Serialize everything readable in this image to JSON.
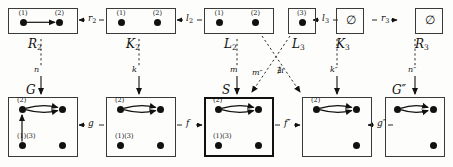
{
  "diagram": {
    "top_row": [
      {
        "id": "R2",
        "name": "R",
        "sub": "2",
        "x": 8,
        "y": 8,
        "w": 70,
        "h": 26,
        "thick": false,
        "nodes": [
          {
            "x": 0.22,
            "y": 0.55,
            "label": "(1)"
          },
          {
            "x": 0.74,
            "y": 0.55,
            "label": "(2)"
          }
        ],
        "edges": [
          {
            "from": 0,
            "to": 1,
            "type": "straight"
          }
        ]
      },
      {
        "id": "K2",
        "name": "K",
        "sub": "2",
        "x": 106,
        "y": 8,
        "w": 70,
        "h": 26,
        "thick": false,
        "nodes": [
          {
            "x": 0.22,
            "y": 0.55,
            "label": "(1)"
          },
          {
            "x": 0.74,
            "y": 0.55,
            "label": "(2)"
          }
        ],
        "edges": []
      },
      {
        "id": "L2",
        "name": "L",
        "sub": "2",
        "x": 204,
        "y": 8,
        "w": 70,
        "h": 26,
        "thick": false,
        "nodes": [
          {
            "x": 0.22,
            "y": 0.55,
            "label": "(1)"
          },
          {
            "x": 0.74,
            "y": 0.55,
            "label": "(2)"
          }
        ],
        "edges": []
      },
      {
        "id": "L3",
        "name": "L",
        "sub": "3",
        "x": 288,
        "y": 8,
        "w": 28,
        "h": 26,
        "thick": false,
        "nodes": [
          {
            "x": 0.5,
            "y": 0.55,
            "label": "(3)"
          }
        ],
        "edges": []
      },
      {
        "id": "K3",
        "name": "K",
        "sub": "3",
        "x": 336,
        "y": 8,
        "w": 28,
        "h": 26,
        "thick": false,
        "nodes": [],
        "empty": "∅",
        "edges": []
      },
      {
        "id": "R3",
        "name": "R",
        "sub": "3",
        "x": 415,
        "y": 8,
        "w": 28,
        "h": 26,
        "thick": false,
        "nodes": [],
        "empty": "∅",
        "edges": []
      }
    ],
    "bottom_row": [
      {
        "id": "G",
        "name": "G",
        "sub": "",
        "x": 8,
        "y": 97,
        "w": 70,
        "h": 60,
        "thick": false,
        "nodes": [
          {
            "x": 0.2,
            "y": 0.2,
            "label": "(2)"
          },
          {
            "x": 0.78,
            "y": 0.2,
            "label": ""
          },
          {
            "x": 0.2,
            "y": 0.8,
            "label": "(1)(3)"
          },
          {
            "x": 0.78,
            "y": 0.8,
            "label": ""
          }
        ],
        "edges": [
          {
            "from": 0,
            "to": 1,
            "type": "double"
          },
          {
            "from": 2,
            "to": 0,
            "type": "vertical"
          }
        ]
      },
      {
        "id": "D",
        "name": "",
        "sub": "",
        "x": 106,
        "y": 97,
        "w": 70,
        "h": 60,
        "thick": false,
        "nodes": [
          {
            "x": 0.2,
            "y": 0.2,
            "label": "(2)"
          },
          {
            "x": 0.78,
            "y": 0.2,
            "label": ""
          },
          {
            "x": 0.2,
            "y": 0.8,
            "label": "(1)(3)"
          },
          {
            "x": 0.78,
            "y": 0.8,
            "label": ""
          }
        ],
        "edges": [
          {
            "from": 0,
            "to": 1,
            "type": "double"
          }
        ]
      },
      {
        "id": "S",
        "name": "S",
        "sub": "",
        "x": 204,
        "y": 97,
        "w": 70,
        "h": 60,
        "thick": true,
        "nodes": [
          {
            "x": 0.2,
            "y": 0.2,
            "label": "(2)"
          },
          {
            "x": 0.78,
            "y": 0.2,
            "label": ""
          },
          {
            "x": 0.2,
            "y": 0.8,
            "label": "(1)(3)"
          },
          {
            "x": 0.78,
            "y": 0.8,
            "label": ""
          }
        ],
        "edges": [
          {
            "from": 0,
            "to": 1,
            "type": "double"
          }
        ]
      },
      {
        "id": "Dpp",
        "name": "",
        "sub": "",
        "x": 302,
        "y": 97,
        "w": 70,
        "h": 60,
        "thick": false,
        "nodes": [
          {
            "x": 0.2,
            "y": 0.2,
            "label": "(2)"
          },
          {
            "x": 0.78,
            "y": 0.2,
            "label": ""
          },
          {
            "x": 0.78,
            "y": 0.8,
            "label": ""
          }
        ],
        "edges": [
          {
            "from": 0,
            "to": 1,
            "type": "double"
          }
        ]
      },
      {
        "id": "Gpp",
        "name": "G″",
        "sub": "",
        "x": 385,
        "y": 97,
        "w": 60,
        "h": 60,
        "thick": false,
        "nodes": [
          {
            "x": 0.2,
            "y": 0.2,
            "label": ""
          },
          {
            "x": 0.8,
            "y": 0.2,
            "label": ""
          },
          {
            "x": 0.8,
            "y": 0.8,
            "label": ""
          }
        ],
        "edges": [
          {
            "from": 0,
            "to": 1,
            "type": "double"
          }
        ]
      }
    ],
    "horizontal_morphisms": [
      {
        "label": "r",
        "sub": "2",
        "x": 88,
        "y": 16,
        "dir": "left"
      },
      {
        "label": "l",
        "sub": "2",
        "x": 186,
        "y": 16,
        "dir": "left"
      },
      {
        "label": "l",
        "sub": "3",
        "x": 322,
        "y": 16,
        "dir": "left"
      },
      {
        "label": "r",
        "sub": "3",
        "x": 381,
        "y": 16,
        "dir": "right"
      },
      {
        "label": "g",
        "sub": "",
        "x": 88,
        "y": 121,
        "dir": "left"
      },
      {
        "label": "f",
        "sub": "",
        "x": 186,
        "y": 121,
        "dir": "right"
      },
      {
        "label": "f″",
        "sub": "",
        "x": 284,
        "y": 121,
        "dir": "right"
      },
      {
        "label": "g″",
        "sub": "",
        "x": 377,
        "y": 121,
        "dir": "left"
      }
    ],
    "vertical_morphisms": [
      {
        "label": "n",
        "x": 41,
        "y": 72
      },
      {
        "label": "k",
        "x": 139,
        "y": 72
      },
      {
        "label": "m",
        "x": 237,
        "y": 72
      },
      {
        "label": "k″",
        "x": 337,
        "y": 72
      },
      {
        "label": "n″",
        "x": 415,
        "y": 72
      }
    ],
    "diagonal_morphisms": [
      {
        "label": "m″",
        "x": 252,
        "y": 68
      },
      {
        "label": "∄i",
        "x": 277,
        "y": 66
      }
    ],
    "box_names": [
      {
        "text": "R",
        "sub": "2",
        "x": 28,
        "y": 37
      },
      {
        "text": "K",
        "sub": "2",
        "x": 126,
        "y": 37
      },
      {
        "text": "L",
        "sub": "2",
        "x": 224,
        "y": 37
      },
      {
        "text": "L",
        "sub": "3",
        "x": 292,
        "y": 37
      },
      {
        "text": "K",
        "sub": "3",
        "x": 336,
        "y": 37
      },
      {
        "text": "R",
        "sub": "3",
        "x": 415,
        "y": 37
      },
      {
        "text": "G",
        "sub": "",
        "x": 26,
        "y": 83
      },
      {
        "text": "S",
        "sub": "",
        "x": 222,
        "y": 83
      },
      {
        "text": "G″",
        "sub": "",
        "x": 392,
        "y": 83
      }
    ]
  }
}
